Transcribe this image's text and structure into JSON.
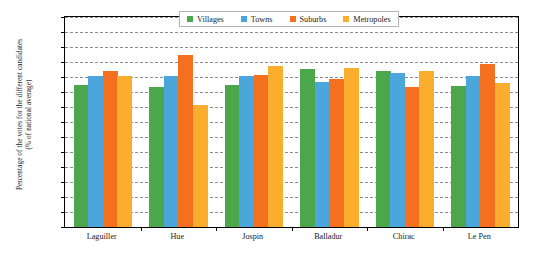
{
  "chart_data": {
    "type": "bar",
    "title": "",
    "subtitle": "",
    "xlabel": "",
    "ylabel_line1": "Percentage of the votes for the different candidates",
    "ylabel_line2": "(% of national average)",
    "categories": [
      "Laguiller",
      "Hue",
      "Jospin",
      "Balladur",
      "Chirac",
      "Le Pen"
    ],
    "series": [
      {
        "name": "Villages",
        "color": "#4CA64C",
        "values": [
          94.5,
          93.5,
          94.5,
          105.5,
          104.0,
          94.0
        ]
      },
      {
        "name": "Towns",
        "color": "#4BA6DB",
        "values": [
          100.5,
          100.5,
          100.5,
          97.0,
          102.5,
          101.0
        ]
      },
      {
        "name": "Suburbs",
        "color": "#F4701E",
        "values": [
          104.0,
          114.5,
          101.5,
          98.5,
          93.5,
          109.0
        ]
      },
      {
        "name": "Metropoles",
        "color": "#FBAE2E",
        "values": [
          100.5,
          81.5,
          107.5,
          106.0,
          104.0,
          96.0
        ]
      }
    ],
    "ylim": [
      0,
      140
    ],
    "ytick_step": 10,
    "ytick_labels": [
      "0%",
      "10%",
      "20%",
      "30%",
      "40%",
      "50%",
      "60%",
      "70%",
      "80%",
      "90%",
      "100%",
      "110%",
      "120%",
      "130%",
      "140%"
    ],
    "grid": true,
    "grid_style": "dashed",
    "grid_color": "#8c8c8c",
    "legend_position": "top-center",
    "frame": true
  },
  "legend": {
    "items": [
      {
        "label": "Villages"
      },
      {
        "label": "Towns"
      },
      {
        "label": "Suburbs"
      },
      {
        "label": "Metropoles"
      }
    ]
  }
}
